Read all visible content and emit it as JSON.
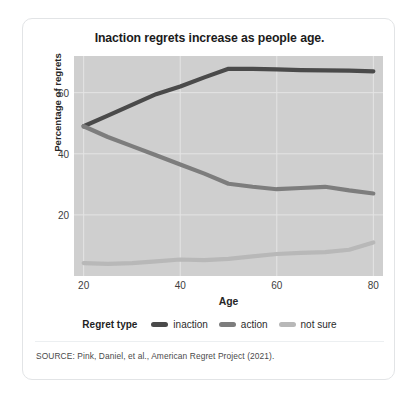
{
  "chart_data": {
    "type": "line",
    "title": "Inaction regrets increase as people age.",
    "xlabel": "Age",
    "ylabel": "Percentage of regrets",
    "xlim": [
      18,
      82
    ],
    "ylim": [
      0,
      72
    ],
    "xticks": [
      20,
      40,
      60,
      80
    ],
    "yticks": [
      20,
      40,
      60
    ],
    "grid": true,
    "legend_title": "Regret type",
    "legend_position": "bottom",
    "plot_background": "#cfcfcf",
    "gridline_color": "#e4e4e4",
    "x": [
      20,
      25,
      30,
      35,
      40,
      45,
      50,
      55,
      60,
      65,
      70,
      75,
      80
    ],
    "series": [
      {
        "name": "inaction",
        "color": "#4a4a4a",
        "values": [
          49.0,
          52.5,
          56.0,
          59.5,
          62.0,
          65.0,
          67.8,
          67.8,
          67.6,
          67.4,
          67.3,
          67.2,
          67.0
        ]
      },
      {
        "name": "action",
        "color": "#7d7d7d",
        "values": [
          49.0,
          45.5,
          42.5,
          39.5,
          36.5,
          33.5,
          30.2,
          29.2,
          28.4,
          28.8,
          29.2,
          28.0,
          27.0
        ]
      },
      {
        "name": "not sure",
        "color": "#b8b8b8",
        "values": [
          4.2,
          4.0,
          4.2,
          4.8,
          5.4,
          5.2,
          5.6,
          6.4,
          7.2,
          7.6,
          7.8,
          8.6,
          11.0
        ]
      }
    ],
    "source": "SOURCE: Pink, Daniel, et al., American Regret Project (2021)."
  },
  "legend": {
    "title": "Regret type",
    "items": [
      {
        "label": "inaction",
        "color": "#4a4a4a"
      },
      {
        "label": "action",
        "color": "#7d7d7d"
      },
      {
        "label": "not sure",
        "color": "#b8b8b8"
      }
    ]
  },
  "axis": {
    "y_title": "Percentage of regrets",
    "x_title": "Age",
    "y_tick_labels": [
      "60",
      "40",
      "20"
    ],
    "x_tick_labels": [
      "20",
      "40",
      "60",
      "80"
    ]
  },
  "footer": {
    "source": "SOURCE: Pink, Daniel, et al., American Regret Project (2021)."
  }
}
